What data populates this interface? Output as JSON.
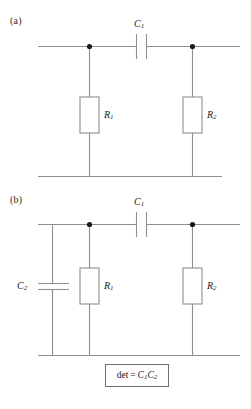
{
  "figure": {
    "type": "circuit-diagram",
    "background": "#ffffff",
    "wire_color": "#8f8f8f",
    "node_color": "#1a1a1a",
    "box_stroke": "#8f8f8f",
    "text_color": "#1d1d1d"
  },
  "panels": [
    {
      "id": "a",
      "label": "(a)",
      "components": [
        {
          "name": "C1",
          "symbol": "C",
          "subscript": "1",
          "kind": "capacitor",
          "orientation": "vertical-plates"
        },
        {
          "name": "R1",
          "symbol": "R",
          "subscript": "1",
          "kind": "resistor",
          "orientation": "vertical"
        },
        {
          "name": "R2",
          "symbol": "R",
          "subscript": "2",
          "kind": "resistor",
          "orientation": "vertical"
        }
      ]
    },
    {
      "id": "b",
      "label": "(b)",
      "components": [
        {
          "name": "C1",
          "symbol": "C",
          "subscript": "1",
          "kind": "capacitor",
          "orientation": "vertical-plates"
        },
        {
          "name": "C2",
          "symbol": "C",
          "subscript": "2",
          "kind": "capacitor",
          "orientation": "horizontal-plates"
        },
        {
          "name": "R1",
          "symbol": "R",
          "subscript": "1",
          "kind": "resistor",
          "orientation": "vertical"
        },
        {
          "name": "R2",
          "symbol": "R",
          "subscript": "2",
          "kind": "resistor",
          "orientation": "vertical"
        }
      ],
      "annotation": {
        "prefix": "det",
        "equals": "=",
        "term1_symbol": "C",
        "term1_sub": "1",
        "term2_symbol": "C",
        "term2_sub": "2"
      }
    }
  ],
  "labels": {
    "panel_a": "(a)",
    "panel_b": "(b)",
    "c1_a": "C",
    "c1_a_sub": "1",
    "r1_a": "R",
    "r1_a_sub": "1",
    "r2_a": "R",
    "r2_a_sub": "2",
    "c1_b": "C",
    "c1_b_sub": "1",
    "c2_b": "C",
    "c2_b_sub": "2",
    "r1_b": "R",
    "r1_b_sub": "1",
    "r2_b": "R",
    "r2_b_sub": "2",
    "det_prefix": "det",
    "det_equals": "=",
    "det_c1": "C",
    "det_c1_sub": "1",
    "det_c2": "C",
    "det_c2_sub": "2"
  }
}
